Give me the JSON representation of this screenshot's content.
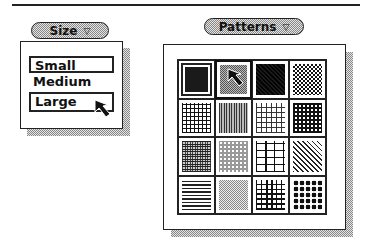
{
  "size_menu": {
    "button_label": "Size",
    "arrow_icon": "▽",
    "items": [
      {
        "label": "Small",
        "state": "framed"
      },
      {
        "label": "Medium",
        "state": "normal"
      },
      {
        "label": "Large",
        "state": "highlighted-under-cursor"
      }
    ]
  },
  "patterns_menu": {
    "button_label": "Patterns",
    "arrow_icon": "▽",
    "rows": 4,
    "columns": 4,
    "patterns": [
      [
        "solid-black",
        "gray-50",
        "dense-diagonal-check",
        "fine-checker"
      ],
      [
        "cross-hatch-plus",
        "vertical-lines",
        "open-square-lattice",
        "dense-black-lattice"
      ],
      [
        "fine-grid-dense",
        "hexagon-dots",
        "brick",
        "diagonal-lines"
      ],
      [
        "horizontal-lines",
        "stipple-light",
        "grid-lines",
        "large-dots"
      ]
    ],
    "selected_index": 0,
    "cursor_over_index": 1
  }
}
